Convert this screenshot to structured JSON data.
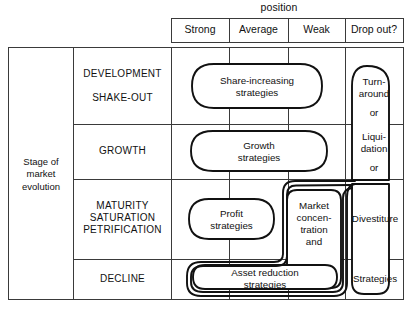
{
  "figure": {
    "top_axis_title": "position",
    "left_axis_title": "Stage of\nmarket\nevolution"
  },
  "columns": [
    {
      "id": "strong",
      "label": "Strong"
    },
    {
      "id": "average",
      "label": "Average"
    },
    {
      "id": "weak",
      "label": "Weak"
    },
    {
      "id": "dropout",
      "label": "Drop out?"
    }
  ],
  "rows": [
    {
      "id": "development-shakeout",
      "label": "DEVELOPMENT\n\nSHAKE-OUT"
    },
    {
      "id": "growth",
      "label": "GROWTH"
    },
    {
      "id": "maturity",
      "label": "MATURITY\nSATURATION\nPETRIFICATION"
    },
    {
      "id": "decline",
      "label": "DECLINE"
    }
  ],
  "cells": {
    "share_increasing": "Share-increasing\nstrategies",
    "growth_strategies": "Growth\nstrategies",
    "profit_strategies": "Profit\nstrategies",
    "market_concentration": "Market\nconcen-\ntration\nand",
    "asset_reduction": "Asset reduction\nstrategies",
    "turnaround": "Turn-\naround",
    "or_1": "or",
    "liquidation": "Liqui-\ndation",
    "or_2": "or",
    "divestiture": "Divestiture",
    "strategies": "Strategies"
  },
  "style": {
    "grid_color": "#3a3a3a",
    "outline_color": "#111111",
    "background": "#ffffff"
  }
}
